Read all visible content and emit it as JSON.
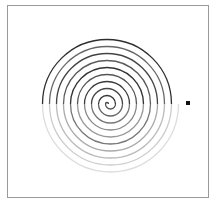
{
  "diagram": {
    "type": "semicircle-spiral",
    "frame_color": "#9a9a9a",
    "center": [
      108,
      104
    ],
    "top_center_x": 107,
    "bottom_center_x": 110.5,
    "start_radius": 1.5,
    "radius_step": 3.6,
    "turns": 10,
    "stroke_width": 1.3,
    "arc_colors": [
      "#444444",
      "#555555",
      "#333333",
      "#666666",
      "#444444",
      "#777777",
      "#3a3a3a",
      "#888888",
      "#555555",
      "#999999",
      "#333333",
      "#777777",
      "#5a5a5a",
      "#aaaaaa",
      "#444444",
      "#bbbbbb",
      "#666666",
      "#cccccc",
      "#2e2e2e",
      "#dddddd"
    ],
    "end_marker": {
      "shape": "square",
      "x": 188,
      "y": 103,
      "color": "#111111"
    }
  }
}
